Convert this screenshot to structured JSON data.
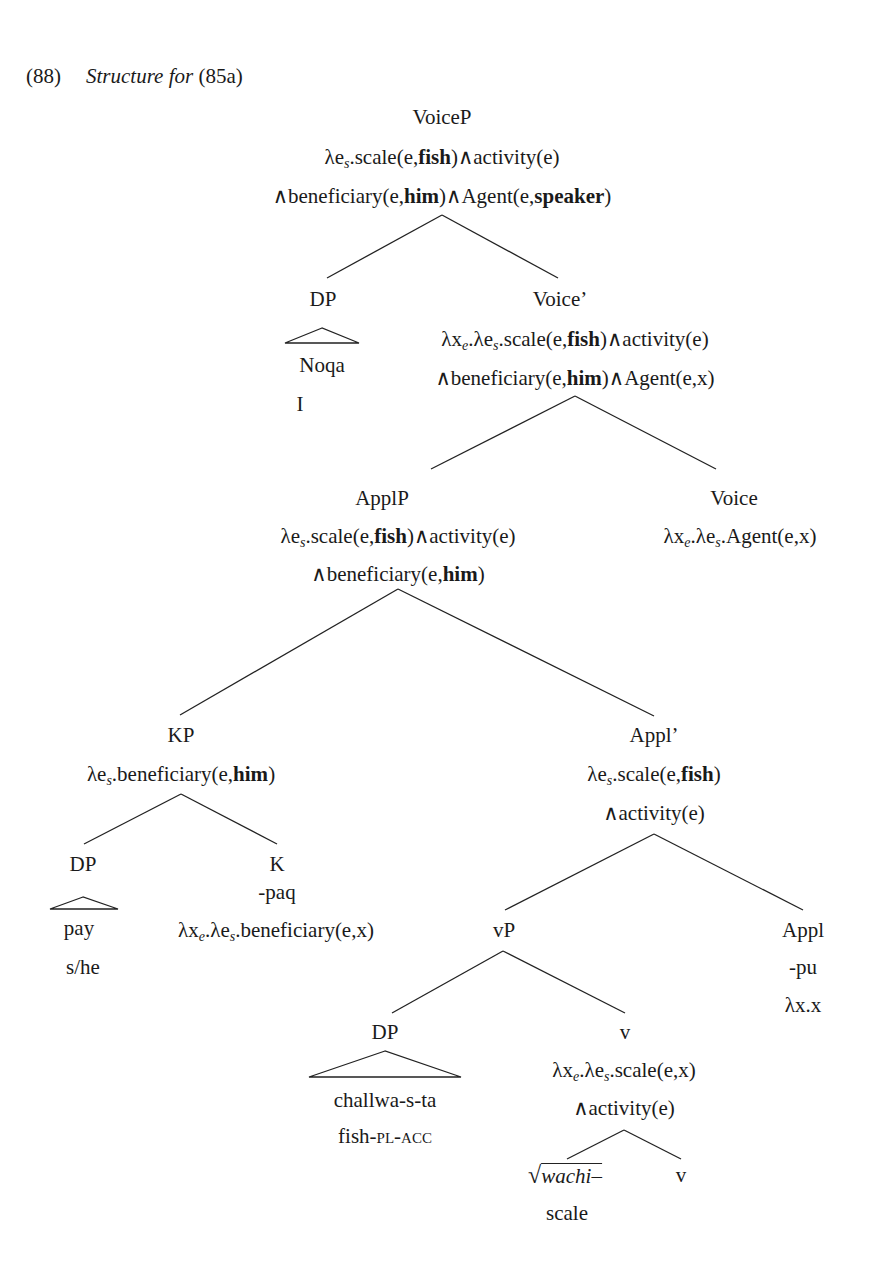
{
  "example": {
    "number": "(88)",
    "caption": "Structure for",
    "ref": "(85a)"
  },
  "nodes": {
    "voiceP": {
      "label": "VoiceP",
      "sem1": "λe_s.scale(e,fish)∧activity(e)",
      "sem2": "∧beneficiary(e,him)∧Agent(e,speaker)"
    },
    "dp1": {
      "label": "DP",
      "word": "Noqa",
      "gloss": "I"
    },
    "voiceBar": {
      "label": "Voice’",
      "sem1": "λx_e.λe_s.scale(e,fish)∧activity(e)",
      "sem2": "∧beneficiary(e,him)∧Agent(e,x)"
    },
    "applP": {
      "label": "ApplP",
      "sem1": "λe_s.scale(e,fish)∧activity(e)",
      "sem2": "∧beneficiary(e,him)"
    },
    "voice": {
      "label": "Voice",
      "sem1": "λx_e.λe_s.Agent(e,x)"
    },
    "kp": {
      "label": "KP",
      "sem1": "λe_s.beneficiary(e,him)"
    },
    "applBar": {
      "label": "Appl’",
      "sem1": "λe_s.scale(e,fish)",
      "sem2": "∧activity(e)"
    },
    "dp2": {
      "label": "DP",
      "word": "pay",
      "gloss": "s/he"
    },
    "k": {
      "label": "K",
      "morph": "-paq",
      "sem1": "λx_e.λe_s.beneficiary(e,x)"
    },
    "vP": {
      "label": "vP"
    },
    "appl": {
      "label": "Appl",
      "morph": "-pu",
      "sem1": "λx.x"
    },
    "dp3": {
      "label": "DP",
      "word": "challwa-s-ta",
      "gloss_stem": "fish-",
      "gloss_caps": "pl-acc"
    },
    "v": {
      "label": "v",
      "sem1": "λx_e.λe_s.scale(e,x)",
      "sem2": "∧activity(e)"
    },
    "root": {
      "label": "wachi–",
      "gloss": "scale"
    },
    "v2": {
      "label": "v"
    }
  }
}
